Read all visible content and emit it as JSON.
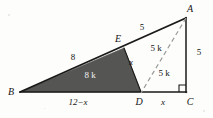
{
  "figure": {
    "canvas": {
      "width": 213,
      "height": 118
    },
    "colors": {
      "shade_fill": "#555553",
      "stroke": "#1a1a1a",
      "dashed_stroke": "#9a9a98",
      "background": "#fdfdfb",
      "label_on_shade": "#f2f2f2"
    },
    "vertices": [
      {
        "id": "A",
        "label": "A",
        "x": 186,
        "y": 18,
        "label_x": 190,
        "label_y": 9
      },
      {
        "id": "B",
        "label": "B",
        "x": 20,
        "y": 92,
        "label_x": 11,
        "label_y": 92
      },
      {
        "id": "C",
        "label": "C",
        "x": 186,
        "y": 92,
        "label_x": 190,
        "label_y": 102
      },
      {
        "id": "D",
        "label": "D",
        "x": 141,
        "y": 92,
        "label_x": 139,
        "label_y": 102
      },
      {
        "id": "E",
        "label": "E",
        "x": 124,
        "y": 48,
        "label_x": 118,
        "label_y": 39
      }
    ],
    "edges": [
      {
        "id": "BA",
        "from": "B",
        "to": "A",
        "style": "solid",
        "weight": 1.8
      },
      {
        "id": "BC",
        "from": "B",
        "to": "C",
        "style": "solid",
        "weight": 1.5
      },
      {
        "id": "AC",
        "from": "A",
        "to": "C",
        "style": "solid",
        "weight": 1.5
      },
      {
        "id": "ED",
        "from": "E",
        "to": "D",
        "style": "solid",
        "weight": 1.2
      },
      {
        "id": "AD",
        "from": "A",
        "to": "D",
        "style": "dashed",
        "weight": 1.1
      }
    ],
    "shaded_region": {
      "id": "BED",
      "vertex_ids": [
        "B",
        "E",
        "D"
      ],
      "fill": "#555553"
    },
    "right_angle": {
      "at": "C",
      "size": 7
    },
    "measure_labels": [
      {
        "id": "BE",
        "text": "8",
        "x": 73,
        "y": 57,
        "kind": "number",
        "on_shade": false
      },
      {
        "id": "EA",
        "text": "5",
        "x": 142,
        "y": 27,
        "kind": "number",
        "on_shade": false
      },
      {
        "id": "BED-area",
        "text": "8 k",
        "x": 90,
        "y": 75,
        "kind": "mixed",
        "on_shade": true
      },
      {
        "id": "ED",
        "text": "x",
        "x": 131,
        "y": 62,
        "kind": "var",
        "on_shade": false
      },
      {
        "id": "AED-area",
        "text": "5 k",
        "x": 156,
        "y": 48,
        "kind": "mixed",
        "on_shade": false
      },
      {
        "id": "ADC-area",
        "text": "5 k",
        "x": 164,
        "y": 73,
        "kind": "mixed",
        "on_shade": false
      },
      {
        "id": "AC",
        "text": "5",
        "x": 199,
        "y": 52,
        "kind": "number",
        "on_shade": false
      },
      {
        "id": "BD",
        "text": "12−x",
        "x": 78,
        "y": 102,
        "kind": "var",
        "on_shade": false
      },
      {
        "id": "DC",
        "text": "x",
        "x": 163,
        "y": 102,
        "kind": "var",
        "on_shade": false
      }
    ]
  }
}
